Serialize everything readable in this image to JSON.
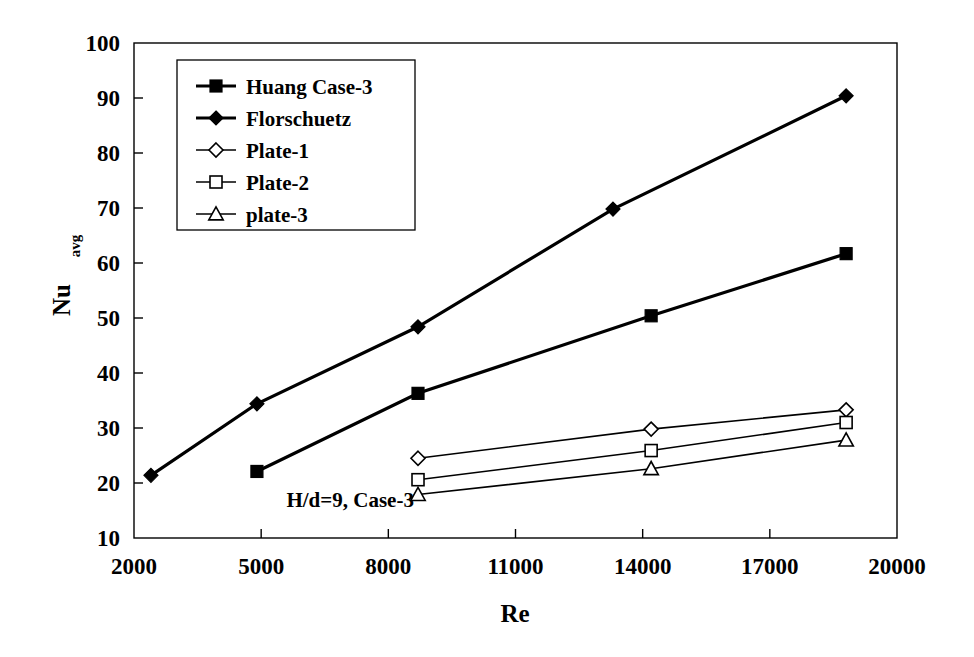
{
  "chart_data": {
    "type": "line",
    "title": "",
    "xlabel": "Re",
    "ylabel": "Nu",
    "ylabel_sub": "avg",
    "xlim": [
      2000,
      20000
    ],
    "ylim": [
      10,
      100
    ],
    "xticks": [
      2000,
      5000,
      8000,
      11000,
      14000,
      17000,
      20000
    ],
    "yticks": [
      10,
      20,
      30,
      40,
      50,
      60,
      70,
      80,
      90,
      100
    ],
    "xtick_labels": [
      "2000",
      "5000",
      "8000",
      "11000",
      "14000",
      "17000",
      "20000"
    ],
    "ytick_labels": [
      "10",
      "20",
      "30",
      "40",
      "50",
      "60",
      "70",
      "80",
      "90",
      "100"
    ],
    "grid": false,
    "legend_position": "upper-left-inside",
    "annotations": [
      {
        "text": "H/d=9, Case-3",
        "x": 7100,
        "y": 15.6
      }
    ],
    "series": [
      {
        "name": "Huang Case-3",
        "marker": "filled-square",
        "line_weight": "bold",
        "x": [
          4900,
          8700,
          14200,
          18800
        ],
        "y": [
          22.1,
          36.3,
          50.4,
          61.7
        ]
      },
      {
        "name": "Florschuetz",
        "marker": "filled-diamond",
        "line_weight": "bold",
        "x": [
          2400,
          4900,
          8700,
          13300,
          18800
        ],
        "y": [
          21.4,
          34.4,
          48.4,
          69.8,
          90.4
        ]
      },
      {
        "name": "Plate-1",
        "marker": "open-diamond",
        "line_weight": "thin",
        "x": [
          8700,
          14200,
          18800
        ],
        "y": [
          24.5,
          29.8,
          33.3
        ]
      },
      {
        "name": "Plate-2",
        "marker": "open-square",
        "line_weight": "thin",
        "x": [
          8700,
          14200,
          18800
        ],
        "y": [
          20.6,
          25.9,
          31.0
        ]
      },
      {
        "name": "plate-3",
        "marker": "open-triangle",
        "line_weight": "thin",
        "x": [
          8700,
          14200,
          18800
        ],
        "y": [
          17.9,
          22.6,
          27.8
        ]
      }
    ]
  },
  "legend": {
    "items": [
      {
        "label": "Huang Case-3",
        "marker": "filled-square"
      },
      {
        "label": "Florschuetz",
        "marker": "filled-diamond"
      },
      {
        "label": "Plate-1",
        "marker": "open-diamond"
      },
      {
        "label": "Plate-2",
        "marker": "open-square"
      },
      {
        "label": "plate-3",
        "marker": "open-triangle"
      }
    ]
  },
  "colors": {
    "ink": "#000000",
    "background": "#ffffff"
  }
}
